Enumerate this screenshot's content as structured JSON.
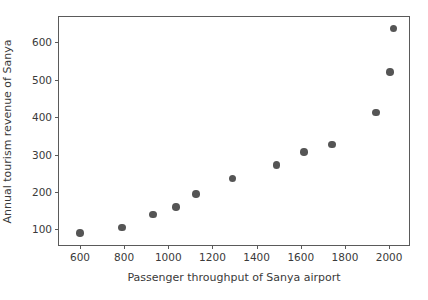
{
  "chart_data": {
    "type": "scatter",
    "title": "",
    "xlabel": "Passenger throughput of Sanya airport",
    "ylabel": "Annual tourism revenue of Sanya",
    "xlim": [
      505,
      2090
    ],
    "ylim": [
      58,
      668
    ],
    "xticks": [
      600,
      800,
      1000,
      1200,
      1400,
      1600,
      1800,
      2000
    ],
    "xticklabels": [
      "600",
      "800",
      "1000",
      "1200",
      "1400",
      "1600",
      "1800",
      "2000"
    ],
    "yticks": [
      100,
      200,
      300,
      400,
      500,
      600
    ],
    "yticklabels": [
      "100",
      "200",
      "300",
      "400",
      "500",
      "600"
    ],
    "grid": false,
    "legend": null,
    "marker_color": "#555555",
    "frame_color": "#5a5a5a",
    "background": "#ffffff",
    "points": [
      {
        "x": 600,
        "y": 90
      },
      {
        "x": 790,
        "y": 105
      },
      {
        "x": 930,
        "y": 140
      },
      {
        "x": 1035,
        "y": 160
      },
      {
        "x": 1125,
        "y": 194
      },
      {
        "x": 1290,
        "y": 236
      },
      {
        "x": 1490,
        "y": 272
      },
      {
        "x": 1615,
        "y": 307
      },
      {
        "x": 1740,
        "y": 327
      },
      {
        "x": 1940,
        "y": 412
      },
      {
        "x": 2005,
        "y": 521
      },
      {
        "x": 2020,
        "y": 637
      }
    ]
  }
}
